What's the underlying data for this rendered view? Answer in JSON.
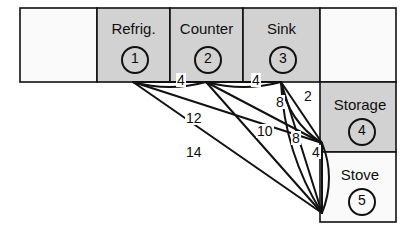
{
  "figure": {
    "type": "facility-layout-graph",
    "title_partial": "",
    "background": "#ffffff",
    "shaded_fill": "#d2d2d2",
    "plain_fill": "#fafafa",
    "line_color": "#111111"
  },
  "grid": {
    "row1": [
      {
        "id": "empty-left",
        "label": "",
        "number": "",
        "shaded": false
      },
      {
        "id": "refrigerator",
        "label": "Refrig.",
        "number": "1",
        "shaded": true
      },
      {
        "id": "counter",
        "label": "Counter",
        "number": "2",
        "shaded": true
      },
      {
        "id": "sink",
        "label": "Sink",
        "number": "3",
        "shaded": true
      },
      {
        "id": "empty-right",
        "label": "",
        "number": "",
        "shaded": false
      }
    ],
    "col_right": [
      {
        "id": "storage",
        "label": "Storage",
        "number": "4",
        "shaded": true
      },
      {
        "id": "stove",
        "label": "Stove",
        "number": "5",
        "shaded": false
      }
    ]
  },
  "nodes": [
    {
      "id": 1,
      "name": "Refrig.",
      "x": 133,
      "y": 82
    },
    {
      "id": 2,
      "name": "Counter",
      "x": 206,
      "y": 82
    },
    {
      "id": 3,
      "name": "Sink",
      "x": 281,
      "y": 82
    },
    {
      "id": 4,
      "name": "Storage",
      "x": 322,
      "y": 143
    },
    {
      "id": 5,
      "name": "Stove",
      "x": 322,
      "y": 213
    }
  ],
  "edges": [
    {
      "from": 1,
      "to": 2,
      "weight": "4",
      "label_x": 176,
      "label_y": 80
    },
    {
      "from": 2,
      "to": 3,
      "weight": "4",
      "label_x": 251,
      "label_y": 80
    },
    {
      "from": 3,
      "to": 4,
      "weight": "2",
      "label_x": 303,
      "label_y": 96
    },
    {
      "from": 2,
      "to": 4,
      "weight": "8",
      "label_x": 275,
      "label_y": 101
    },
    {
      "from": 1,
      "to": 4,
      "weight": "12",
      "label_x": 190,
      "label_y": 118
    },
    {
      "from": 2,
      "to": 5,
      "weight": "10",
      "label_x": 261,
      "label_y": 131
    },
    {
      "from": 3,
      "to": 5,
      "weight": "8",
      "label_x": 291,
      "label_y": 138
    },
    {
      "from": 4,
      "to": 5,
      "weight": "4",
      "label_x": 311,
      "label_y": 152
    },
    {
      "from": 1,
      "to": 5,
      "weight": "14",
      "label_x": 190,
      "label_y": 152
    }
  ],
  "edge_labels_flat": [
    "4",
    "4",
    "2",
    "8",
    "12",
    "10",
    "8",
    "4",
    "14"
  ]
}
